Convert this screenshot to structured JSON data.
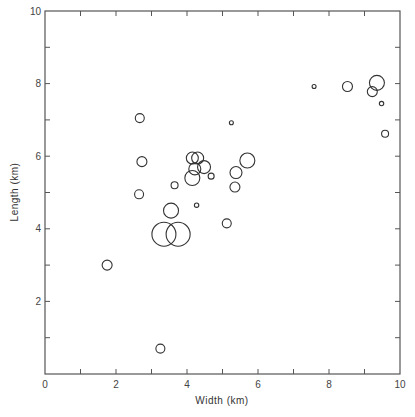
{
  "chart_data": {
    "type": "scatter",
    "title": "",
    "xlabel": "Width (km)",
    "ylabel": "Length (km)",
    "xlim": [
      0,
      10
    ],
    "ylim": [
      0,
      10
    ],
    "x_ticks": [
      0,
      2,
      4,
      6,
      8,
      10
    ],
    "y_ticks": [
      2,
      4,
      6,
      8,
      10
    ],
    "x_minor_ticks": [
      1,
      3,
      5,
      7,
      9
    ],
    "y_minor_ticks": [
      1,
      3,
      5,
      7,
      9
    ],
    "grid": false,
    "legend": null,
    "marker": "open circle (size varies per point)",
    "points": [
      {
        "x": 1.75,
        "y": 3.0,
        "r": 5
      },
      {
        "x": 3.25,
        "y": 0.7,
        "r": 4.5
      },
      {
        "x": 2.67,
        "y": 7.05,
        "r": 4.5
      },
      {
        "x": 2.73,
        "y": 5.85,
        "r": 5
      },
      {
        "x": 2.65,
        "y": 4.95,
        "r": 4.5
      },
      {
        "x": 3.65,
        "y": 5.2,
        "r": 3.5
      },
      {
        "x": 3.55,
        "y": 4.5,
        "r": 7.5
      },
      {
        "x": 3.35,
        "y": 3.85,
        "r": 12
      },
      {
        "x": 3.75,
        "y": 3.85,
        "r": 12
      },
      {
        "x": 4.27,
        "y": 4.65,
        "r": 2.2
      },
      {
        "x": 4.15,
        "y": 5.95,
        "r": 6
      },
      {
        "x": 4.3,
        "y": 5.95,
        "r": 6
      },
      {
        "x": 4.22,
        "y": 5.65,
        "r": 6
      },
      {
        "x": 4.48,
        "y": 5.7,
        "r": 6.5
      },
      {
        "x": 4.15,
        "y": 5.4,
        "r": 7.5
      },
      {
        "x": 4.68,
        "y": 5.45,
        "r": 3
      },
      {
        "x": 5.25,
        "y": 6.92,
        "r": 2
      },
      {
        "x": 5.7,
        "y": 5.88,
        "r": 7.5
      },
      {
        "x": 5.38,
        "y": 5.55,
        "r": 6
      },
      {
        "x": 5.35,
        "y": 5.15,
        "r": 5
      },
      {
        "x": 5.12,
        "y": 4.15,
        "r": 4.5
      },
      {
        "x": 7.58,
        "y": 7.92,
        "r": 2
      },
      {
        "x": 8.52,
        "y": 7.92,
        "r": 5
      },
      {
        "x": 9.35,
        "y": 8.02,
        "r": 7.5
      },
      {
        "x": 9.22,
        "y": 7.78,
        "r": 5
      },
      {
        "x": 9.48,
        "y": 7.45,
        "r": 2.2
      },
      {
        "x": 9.58,
        "y": 6.62,
        "r": 3.5
      }
    ]
  },
  "axes": {
    "x_label": "Width (km)",
    "y_label": "Length (km)",
    "x_tick_labels": [
      "0",
      "2",
      "4",
      "6",
      "8",
      "10"
    ],
    "y_tick_labels": [
      "2",
      "4",
      "6",
      "8",
      "10"
    ]
  }
}
